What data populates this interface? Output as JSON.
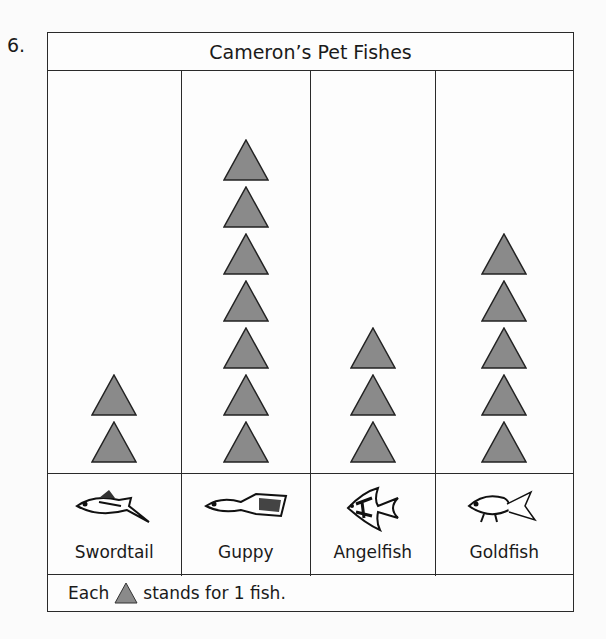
{
  "question_number": "6.",
  "title": "Cameron’s Pet Fishes",
  "key": {
    "prefix": "Each",
    "suffix": "stands for 1 fish.",
    "symbol": "triangle-icon"
  },
  "colors": {
    "triangle_fill": "#8a8a8a",
    "border": "#2a2a2a"
  },
  "columns": [
    {
      "label": "Swordtail",
      "count": 2,
      "icon": "swordtail-fish-icon"
    },
    {
      "label": "Guppy",
      "count": 7,
      "icon": "guppy-fish-icon"
    },
    {
      "label": "Angelfish",
      "count": 3,
      "icon": "angelfish-icon"
    },
    {
      "label": "Goldfish",
      "count": 5,
      "icon": "goldfish-icon"
    }
  ],
  "chart_data": {
    "type": "bar",
    "title": "Cameron’s Pet Fishes",
    "categories": [
      "Swordtail",
      "Guppy",
      "Angelfish",
      "Goldfish"
    ],
    "values": [
      2,
      7,
      3,
      5
    ],
    "xlabel": "",
    "ylabel": "",
    "legend": "Each triangle stands for 1 fish.",
    "ylim": [
      0,
      8
    ]
  }
}
